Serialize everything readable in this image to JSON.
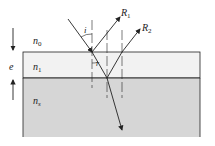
{
  "diagram": {
    "labels": {
      "R1": "R",
      "R1_sub": "1",
      "R2": "R",
      "R2_sub": "2",
      "angle_i": "i",
      "angle_r": "r",
      "n0": "n",
      "n0_sub": "0",
      "n1": "n",
      "n1_sub": "1",
      "ns": "n",
      "ns_sub": "s",
      "thickness": "e"
    },
    "colors": {
      "film": "#f2f2f2",
      "substrate": "#d6d6d6",
      "line": "#222222"
    }
  }
}
